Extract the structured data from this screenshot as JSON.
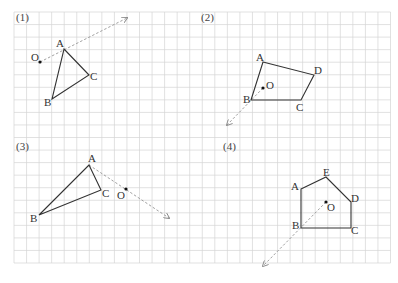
{
  "grid": {
    "x0": 14,
    "y0": 12,
    "cell": 12.55,
    "cols": 30,
    "rows": 20,
    "line_color": "#d4d4d4"
  },
  "colors": {
    "shape": "#333333",
    "arrow": "#888888",
    "point": "#111111"
  },
  "panels": [
    {
      "label": "(1)",
      "label_pos": [
        16,
        21
      ],
      "polygon": [
        {
          "name": "A",
          "x": 64,
          "y": 49,
          "lx": 56,
          "ly": 47
        },
        {
          "name": "C",
          "x": 89,
          "y": 75,
          "lx": 90,
          "ly": 80
        },
        {
          "name": "B",
          "x": 52,
          "y": 99,
          "lx": 44,
          "ly": 106
        }
      ],
      "center": {
        "name": "O",
        "x": 40,
        "y": 62,
        "lx": 31,
        "ly": 61
      },
      "arrow": {
        "x1": 40,
        "y1": 62,
        "x2": 127,
        "y2": 18
      }
    },
    {
      "label": "(2)",
      "label_pos": [
        201,
        21
      ],
      "polygon": [
        {
          "name": "A",
          "x": 263,
          "y": 62,
          "lx": 256,
          "ly": 61
        },
        {
          "name": "D",
          "x": 314,
          "y": 75,
          "lx": 314,
          "ly": 74
        },
        {
          "name": "C",
          "x": 301,
          "y": 100,
          "lx": 296,
          "ly": 111
        },
        {
          "name": "B",
          "x": 251,
          "y": 100,
          "lx": 243,
          "ly": 103
        }
      ],
      "center": {
        "name": "O",
        "x": 263,
        "y": 88,
        "lx": 266,
        "ly": 89
      },
      "arrow": {
        "x1": 263,
        "y1": 88,
        "x2": 227,
        "y2": 125
      }
    },
    {
      "label": "(3)",
      "label_pos": [
        16,
        150
      ],
      "polygon": [
        {
          "name": "A",
          "x": 89,
          "y": 165,
          "lx": 88,
          "ly": 162
        },
        {
          "name": "C",
          "x": 101,
          "y": 190,
          "lx": 102,
          "ly": 197
        },
        {
          "name": "B",
          "x": 39,
          "y": 215,
          "lx": 30,
          "ly": 222
        }
      ],
      "center": {
        "name": "O",
        "x": 126,
        "y": 189,
        "lx": 117,
        "ly": 199
      },
      "arrow": {
        "x1": 89,
        "y1": 165,
        "x2": 169,
        "y2": 218
      }
    },
    {
      "label": "(4)",
      "label_pos": [
        223,
        150
      ],
      "polygon": [
        {
          "name": "A",
          "x": 301,
          "y": 189,
          "lx": 291,
          "ly": 190
        },
        {
          "name": "E",
          "x": 326,
          "y": 177,
          "lx": 323,
          "ly": 176
        },
        {
          "name": "D",
          "x": 351,
          "y": 202,
          "lx": 351,
          "ly": 202
        },
        {
          "name": "C",
          "x": 351,
          "y": 228,
          "lx": 351,
          "ly": 234
        },
        {
          "name": "B",
          "x": 301,
          "y": 228,
          "lx": 292,
          "ly": 229
        },
        {
          "name": "A_close",
          "x": 301,
          "y": 189
        }
      ],
      "center": {
        "name": "O",
        "x": 326,
        "y": 202,
        "lx": 327,
        "ly": 211
      },
      "arrow": {
        "x1": 326,
        "y1": 202,
        "x2": 263,
        "y2": 266
      }
    }
  ]
}
